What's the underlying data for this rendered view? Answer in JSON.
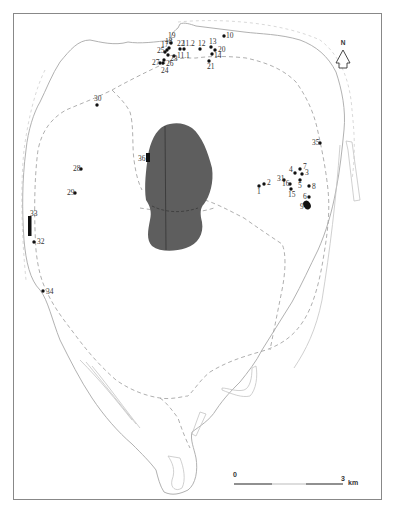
{
  "map": {
    "north_label": "N",
    "scale": {
      "start_label": "0",
      "end_label": "3",
      "unit_label": "km"
    },
    "colors": {
      "lake": "#5e5e5e",
      "site": "#111111",
      "coast": "#a8a8a8",
      "frame": "#888888"
    },
    "sites": [
      {
        "id": "1",
        "label": "1",
        "x": 259,
        "y": 186
      },
      {
        "id": "2",
        "label": "2",
        "x": 264,
        "y": 184
      },
      {
        "id": "3",
        "label": "3",
        "x": 302,
        "y": 174
      },
      {
        "id": "4",
        "label": "4",
        "x": 295,
        "y": 173
      },
      {
        "id": "5",
        "label": "5",
        "x": 300,
        "y": 180
      },
      {
        "id": "6",
        "label": "6",
        "x": 309,
        "y": 197
      },
      {
        "id": "7",
        "label": "7",
        "x": 300,
        "y": 169
      },
      {
        "id": "8",
        "label": "8",
        "x": 309,
        "y": 186
      },
      {
        "id": "9",
        "label": "9",
        "x": 306,
        "y": 204
      },
      {
        "id": "10",
        "label": "10",
        "x": 224,
        "y": 36
      },
      {
        "id": "11.1",
        "label": "11.1",
        "x": 174,
        "y": 56
      },
      {
        "id": "11.2",
        "label": "11.2",
        "x": 184,
        "y": 49
      },
      {
        "id": "12",
        "label": "12",
        "x": 200,
        "y": 49
      },
      {
        "id": "13",
        "label": "13",
        "x": 211,
        "y": 47
      },
      {
        "id": "14",
        "label": "14",
        "x": 212,
        "y": 54
      },
      {
        "id": "15",
        "label": "15",
        "x": 291,
        "y": 189
      },
      {
        "id": "16",
        "label": "16",
        "x": 290,
        "y": 184
      },
      {
        "id": "17",
        "label": "17",
        "x": 167,
        "y": 50
      },
      {
        "id": "18",
        "label": "18",
        "x": 169,
        "y": 48
      },
      {
        "id": "19",
        "label": "19",
        "x": 171,
        "y": 43
      },
      {
        "id": "20",
        "label": "20",
        "x": 215,
        "y": 50
      },
      {
        "id": "21",
        "label": "21",
        "x": 209,
        "y": 61
      },
      {
        "id": "22",
        "label": "22",
        "x": 180,
        "y": 49
      },
      {
        "id": "23",
        "label": "23",
        "x": 168,
        "y": 55
      },
      {
        "id": "24",
        "label": "24",
        "x": 163,
        "y": 63
      },
      {
        "id": "25",
        "label": "25",
        "x": 165,
        "y": 52
      },
      {
        "id": "26",
        "label": "26",
        "x": 164,
        "y": 60
      },
      {
        "id": "27",
        "label": "27",
        "x": 160,
        "y": 63
      },
      {
        "id": "28",
        "label": "28",
        "x": 81,
        "y": 169
      },
      {
        "id": "29",
        "label": "29",
        "x": 75,
        "y": 193
      },
      {
        "id": "30",
        "label": "30",
        "x": 97,
        "y": 105
      },
      {
        "id": "31",
        "label": "31",
        "x": 284,
        "y": 180
      },
      {
        "id": "32",
        "label": "32",
        "x": 34,
        "y": 242
      },
      {
        "id": "33",
        "label": "33",
        "x": 31,
        "y": 220
      },
      {
        "id": "34",
        "label": "34",
        "x": 43,
        "y": 291
      },
      {
        "id": "35",
        "label": "35",
        "x": 320,
        "y": 143
      },
      {
        "id": "36",
        "label": "36",
        "x": 147,
        "y": 158
      }
    ]
  }
}
